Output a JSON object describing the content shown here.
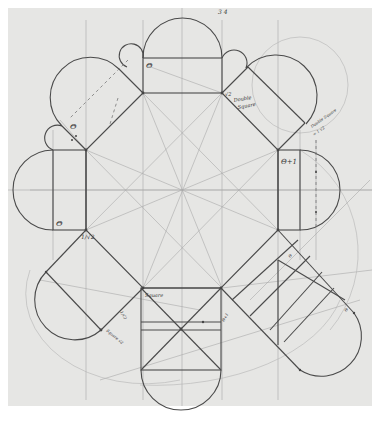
{
  "diagram": {
    "colors": {
      "paper": "#e6e6e4",
      "ink": "#4a4a4a",
      "faint": "#a8a8a8",
      "border": "#ffffff"
    },
    "labels": {
      "top_theta": "Θ",
      "left_upper_theta": "Θ",
      "left_lower_theta": "Θ",
      "right_theta_plus_one": "Θ+1",
      "root2": "√2",
      "double_square": "Double",
      "double_square_2": "Square",
      "right_note_1": "Double Square",
      "right_note_2": "= 1 √2",
      "one_over_root2": "1/√2",
      "square": "Square",
      "left_note": "1/√2",
      "lower_left_note": "Square √2",
      "center_right_note": "Θ+1",
      "right_small_1": "Θ",
      "right_small_2": "Θ",
      "top_scribble": "3 4"
    }
  }
}
